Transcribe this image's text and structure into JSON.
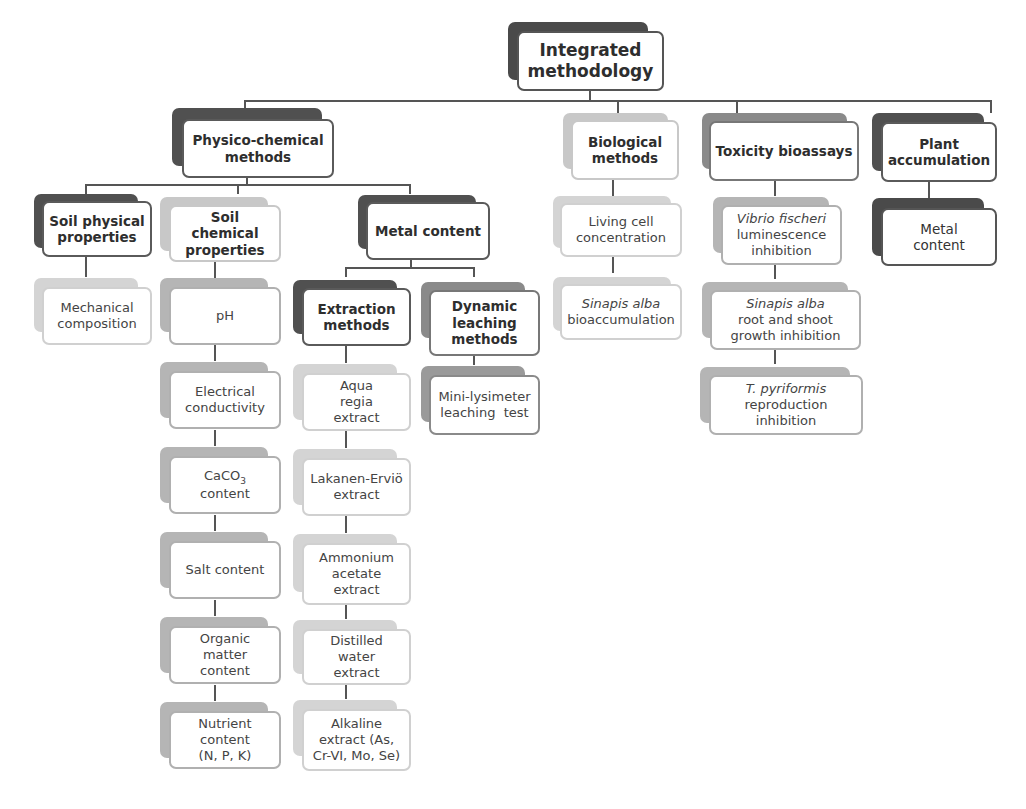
{
  "diagram": {
    "root": "Integrated methodology",
    "branches": {
      "physico_chemical": {
        "label": "Physico-chemical methods",
        "soil_physical": {
          "label": "Soil physical properties",
          "items": [
            "Mechanical composition"
          ]
        },
        "soil_chemical": {
          "label": "Soil chemical properties",
          "items": [
            "pH",
            "Electrical conductivity",
            "CaCO3 content",
            "Salt content",
            "Organic matter content",
            "Nutrient content (N, P, K)"
          ],
          "caco3_prefix": "CaCO",
          "caco3_sub": "3",
          "caco3_suffix": "content"
        },
        "metal_content": {
          "label": "Metal content",
          "extraction": {
            "label": "Extraction methods",
            "items": [
              "Aqua regia extract",
              "Lakanen-Erviö extract",
              "Ammonium acetate extract",
              "Distilled water extract",
              "Alkaline extract (As, Cr-VI, Mo, Se)"
            ]
          },
          "dynamic_leaching": {
            "label": "Dynamic leaching methods",
            "items": [
              "Mini-lysimeter leaching  test"
            ]
          }
        }
      },
      "biological": {
        "label": "Biological methods",
        "items": [
          {
            "text": "Living cell concentration"
          },
          {
            "italic": "Sinapis alba",
            "text": "bioaccumulation"
          }
        ]
      },
      "toxicity": {
        "label": "Toxicity bioassays",
        "items": [
          {
            "italic": "Vibrio fischeri",
            "text": "luminescence inhibition"
          },
          {
            "italic": "Sinapis alba",
            "text": "root and shoot growth inhibition"
          },
          {
            "italic": "T. pyriformis",
            "text": "reproduction inhibition"
          }
        ]
      },
      "plant_accumulation": {
        "label": "Plant accumulation",
        "items": [
          "Metal content"
        ]
      }
    }
  }
}
